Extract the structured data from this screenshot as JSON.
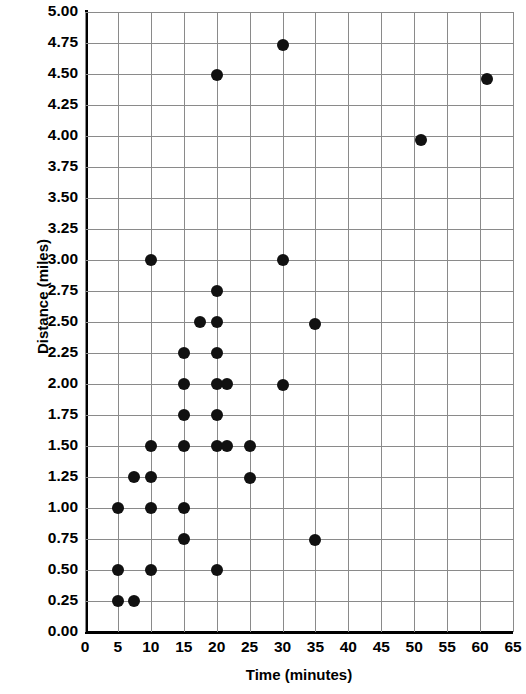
{
  "chart_data": {
    "type": "scatter",
    "title": "",
    "xlabel": "Time (minutes)",
    "ylabel": "Distance (miles)",
    "xlim": [
      0,
      65
    ],
    "ylim": [
      0,
      5.0
    ],
    "xticks": [
      0,
      5,
      10,
      15,
      20,
      25,
      30,
      35,
      40,
      45,
      50,
      55,
      60,
      65
    ],
    "xtick_labels": [
      "0",
      "5",
      "10",
      "15",
      "20",
      "25",
      "30",
      "35",
      "40",
      "45",
      "50",
      "55",
      "60",
      "65"
    ],
    "yticks": [
      0,
      0.25,
      0.5,
      0.75,
      1.0,
      1.25,
      1.5,
      1.75,
      2.0,
      2.25,
      2.5,
      2.75,
      3.0,
      3.25,
      3.5,
      3.75,
      4.0,
      4.25,
      4.5,
      4.75,
      5.0
    ],
    "ytick_labels": [
      "0.00",
      "0.25",
      "0.50",
      "0.75",
      "1.00",
      "1.25",
      "1.50",
      "1.75",
      "2.00",
      "2.25",
      "2.50",
      "2.75",
      "3.00",
      "3.25",
      "3.50",
      "3.75",
      "4.00",
      "4.25",
      "4.50",
      "4.75",
      "5.00"
    ],
    "grid": true,
    "legend": false,
    "marker_color": "#111111",
    "marker_size": 12,
    "points": [
      {
        "x": 5,
        "y": 0.25
      },
      {
        "x": 7.5,
        "y": 0.25
      },
      {
        "x": 5,
        "y": 0.5
      },
      {
        "x": 10,
        "y": 0.5
      },
      {
        "x": 20,
        "y": 0.5
      },
      {
        "x": 15,
        "y": 0.75
      },
      {
        "x": 35,
        "y": 0.74
      },
      {
        "x": 5,
        "y": 1.0
      },
      {
        "x": 10,
        "y": 1.0
      },
      {
        "x": 15,
        "y": 1.0
      },
      {
        "x": 7.5,
        "y": 1.25
      },
      {
        "x": 10,
        "y": 1.25
      },
      {
        "x": 25,
        "y": 1.24
      },
      {
        "x": 10,
        "y": 1.5
      },
      {
        "x": 15,
        "y": 1.5
      },
      {
        "x": 20,
        "y": 1.5
      },
      {
        "x": 21.5,
        "y": 1.5
      },
      {
        "x": 25,
        "y": 1.5
      },
      {
        "x": 15,
        "y": 1.75
      },
      {
        "x": 20,
        "y": 1.75
      },
      {
        "x": 15,
        "y": 2.0
      },
      {
        "x": 20,
        "y": 2.0
      },
      {
        "x": 21.5,
        "y": 2.0
      },
      {
        "x": 30,
        "y": 1.99
      },
      {
        "x": 15,
        "y": 2.25
      },
      {
        "x": 20,
        "y": 2.25
      },
      {
        "x": 17.5,
        "y": 2.5
      },
      {
        "x": 20,
        "y": 2.5
      },
      {
        "x": 35,
        "y": 2.48
      },
      {
        "x": 20,
        "y": 2.75
      },
      {
        "x": 10,
        "y": 3.0
      },
      {
        "x": 30,
        "y": 3.0
      },
      {
        "x": 51,
        "y": 3.97
      },
      {
        "x": 20,
        "y": 4.49
      },
      {
        "x": 61,
        "y": 4.46
      },
      {
        "x": 30,
        "y": 4.73
      }
    ]
  }
}
